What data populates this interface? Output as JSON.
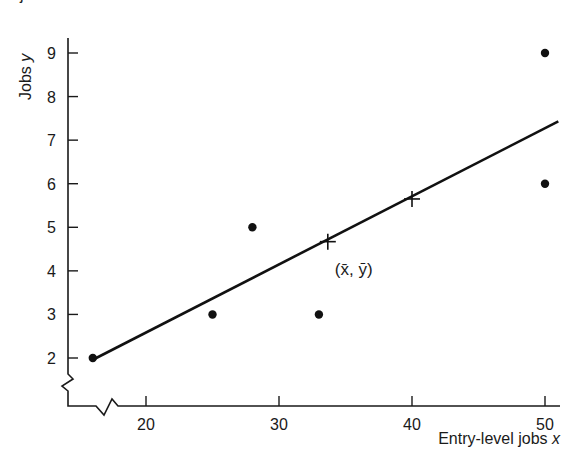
{
  "page": {
    "cut_off_text": "jobs"
  },
  "chart_data": {
    "type": "scatter",
    "title": "",
    "xlabel": "Entry-level jobs",
    "xlabel_var": "x",
    "ylabel": "Jobs",
    "ylabel_var": "y",
    "xlim": [
      14.5,
      51.2
    ],
    "ylim": [
      0.9,
      9.35
    ],
    "x_ticks": [
      20,
      30,
      40,
      50
    ],
    "y_ticks": [
      2,
      3,
      4,
      5,
      6,
      7,
      8,
      9
    ],
    "axis_breaks": {
      "x": true,
      "y": true
    },
    "grid": false,
    "legend": null,
    "points": [
      {
        "x": 16,
        "y": 2
      },
      {
        "x": 25,
        "y": 3
      },
      {
        "x": 28,
        "y": 5
      },
      {
        "x": 33,
        "y": 3
      },
      {
        "x": 50,
        "y": 9
      },
      {
        "x": 50,
        "y": 6
      }
    ],
    "regression_line": {
      "start": {
        "x": 16,
        "y": 1.96
      },
      "end": {
        "x": 51,
        "y": 7.43
      },
      "slope": 0.156
    },
    "markers": [
      {
        "x": 33.67,
        "y": 4.67,
        "shape": "cross",
        "label": "(x̄, ȳ)"
      },
      {
        "x": 40,
        "y": 5.65,
        "shape": "cross",
        "label": ""
      }
    ],
    "annotations": [
      {
        "text": "(x̄, ȳ)",
        "x": 33.67,
        "y": 4.67,
        "position": "below-right"
      }
    ]
  }
}
